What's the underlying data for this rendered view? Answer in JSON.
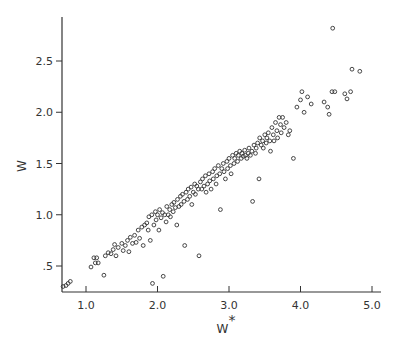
{
  "chart_data": {
    "type": "scatter",
    "title": "",
    "xlabel": "W*",
    "ylabel": "W",
    "xlim": [
      0.66,
      5.13
    ],
    "ylim": [
      0.26,
      2.93
    ],
    "grid": false,
    "legend": null,
    "x_ticks": [
      1.0,
      2.0,
      3.0,
      4.0,
      5.0
    ],
    "x_tick_labels": [
      "1.0",
      "2.0",
      "3.0",
      "4.0",
      "5.0"
    ],
    "y_ticks": [
      0.5,
      1.0,
      1.5,
      2.0,
      2.5
    ],
    "y_tick_labels": [
      ".5",
      "1.0",
      "1.5",
      "2.0",
      "2.5"
    ],
    "marker": "open-circle",
    "series": [
      {
        "name": "observations",
        "points": [
          [
            0.68,
            0.3
          ],
          [
            0.72,
            0.31
          ],
          [
            0.75,
            0.33
          ],
          [
            0.78,
            0.35
          ],
          [
            1.07,
            0.49
          ],
          [
            1.13,
            0.53
          ],
          [
            1.17,
            0.53
          ],
          [
            1.11,
            0.58
          ],
          [
            1.15,
            0.58
          ],
          [
            1.25,
            0.41
          ],
          [
            1.27,
            0.6
          ],
          [
            1.31,
            0.63
          ],
          [
            1.35,
            0.62
          ],
          [
            1.38,
            0.66
          ],
          [
            1.42,
            0.6
          ],
          [
            1.4,
            0.71
          ],
          [
            1.45,
            0.68
          ],
          [
            1.5,
            0.72
          ],
          [
            1.52,
            0.65
          ],
          [
            1.55,
            0.7
          ],
          [
            1.58,
            0.75
          ],
          [
            1.6,
            0.64
          ],
          [
            1.62,
            0.78
          ],
          [
            1.65,
            0.72
          ],
          [
            1.68,
            0.8
          ],
          [
            1.7,
            0.73
          ],
          [
            1.73,
            0.85
          ],
          [
            1.75,
            0.77
          ],
          [
            1.78,
            0.88
          ],
          [
            1.8,
            0.7
          ],
          [
            1.82,
            0.9
          ],
          [
            1.85,
            0.92
          ],
          [
            1.87,
            0.85
          ],
          [
            1.88,
            0.98
          ],
          [
            1.9,
            0.75
          ],
          [
            1.92,
            1.0
          ],
          [
            1.93,
            0.33
          ],
          [
            1.95,
            0.9
          ],
          [
            1.97,
            1.03
          ],
          [
            1.98,
            0.95
          ],
          [
            2.0,
            1.0
          ],
          [
            2.02,
            0.85
          ],
          [
            2.03,
            1.05
          ],
          [
            2.05,
            0.97
          ],
          [
            2.07,
            1.02
          ],
          [
            2.08,
            0.4
          ],
          [
            2.1,
            1.0
          ],
          [
            2.12,
            0.93
          ],
          [
            2.13,
            1.08
          ],
          [
            2.15,
            1.0
          ],
          [
            2.17,
            1.05
          ],
          [
            2.18,
            0.98
          ],
          [
            2.2,
            1.1
          ],
          [
            2.22,
            1.03
          ],
          [
            2.23,
            1.12
          ],
          [
            2.25,
            1.07
          ],
          [
            2.27,
            0.9
          ],
          [
            2.28,
            1.15
          ],
          [
            2.3,
            1.08
          ],
          [
            2.32,
            1.18
          ],
          [
            2.33,
            1.1
          ],
          [
            2.35,
            1.2
          ],
          [
            2.37,
            1.13
          ],
          [
            2.38,
            0.7
          ],
          [
            2.4,
            1.22
          ],
          [
            2.42,
            1.15
          ],
          [
            2.43,
            1.25
          ],
          [
            2.45,
            1.18
          ],
          [
            2.47,
            1.27
          ],
          [
            2.48,
            1.1
          ],
          [
            2.5,
            1.22
          ],
          [
            2.52,
            1.3
          ],
          [
            2.53,
            1.2
          ],
          [
            2.55,
            1.28
          ],
          [
            2.57,
            1.25
          ],
          [
            2.58,
            0.6
          ],
          [
            2.6,
            1.32
          ],
          [
            2.62,
            1.25
          ],
          [
            2.63,
            1.35
          ],
          [
            2.65,
            1.28
          ],
          [
            2.67,
            1.38
          ],
          [
            2.68,
            1.22
          ],
          [
            2.7,
            1.3
          ],
          [
            2.72,
            1.4
          ],
          [
            2.73,
            1.33
          ],
          [
            2.75,
            1.25
          ],
          [
            2.77,
            1.42
          ],
          [
            2.78,
            1.35
          ],
          [
            2.8,
            1.45
          ],
          [
            2.82,
            1.3
          ],
          [
            2.83,
            1.38
          ],
          [
            2.85,
            1.48
          ],
          [
            2.87,
            1.4
          ],
          [
            2.88,
            1.05
          ],
          [
            2.9,
            1.45
          ],
          [
            2.92,
            1.5
          ],
          [
            2.93,
            1.42
          ],
          [
            2.95,
            1.35
          ],
          [
            2.97,
            1.52
          ],
          [
            2.98,
            1.45
          ],
          [
            3.0,
            1.55
          ],
          [
            3.02,
            1.48
          ],
          [
            3.03,
            1.4
          ],
          [
            3.05,
            1.58
          ],
          [
            3.07,
            1.5
          ],
          [
            3.08,
            1.55
          ],
          [
            3.1,
            1.6
          ],
          [
            3.12,
            1.52
          ],
          [
            3.13,
            1.58
          ],
          [
            3.15,
            1.62
          ],
          [
            3.17,
            1.55
          ],
          [
            3.18,
            1.6
          ],
          [
            3.2,
            1.57
          ],
          [
            3.22,
            1.63
          ],
          [
            3.23,
            1.58
          ],
          [
            3.25,
            1.55
          ],
          [
            3.27,
            1.6
          ],
          [
            3.28,
            1.65
          ],
          [
            3.3,
            1.58
          ],
          [
            3.32,
            1.62
          ],
          [
            3.33,
            1.13
          ],
          [
            3.35,
            1.68
          ],
          [
            3.37,
            1.6
          ],
          [
            3.38,
            1.65
          ],
          [
            3.4,
            1.7
          ],
          [
            3.42,
            1.35
          ],
          [
            3.43,
            1.75
          ],
          [
            3.45,
            1.68
          ],
          [
            3.47,
            1.72
          ],
          [
            3.48,
            1.65
          ],
          [
            3.5,
            1.78
          ],
          [
            3.52,
            1.7
          ],
          [
            3.53,
            1.75
          ],
          [
            3.55,
            1.8
          ],
          [
            3.57,
            1.72
          ],
          [
            3.58,
            1.62
          ],
          [
            3.6,
            1.85
          ],
          [
            3.62,
            1.78
          ],
          [
            3.63,
            1.72
          ],
          [
            3.65,
            1.9
          ],
          [
            3.67,
            1.82
          ],
          [
            3.68,
            1.75
          ],
          [
            3.7,
            1.95
          ],
          [
            3.72,
            1.88
          ],
          [
            3.73,
            1.8
          ],
          [
            3.75,
            1.95
          ],
          [
            3.77,
            1.85
          ],
          [
            3.8,
            1.9
          ],
          [
            3.83,
            1.78
          ],
          [
            3.85,
            1.82
          ],
          [
            3.9,
            1.55
          ],
          [
            3.95,
            2.05
          ],
          [
            4.0,
            2.12
          ],
          [
            4.02,
            2.2
          ],
          [
            4.05,
            2.0
          ],
          [
            4.1,
            2.15
          ],
          [
            4.15,
            2.08
          ],
          [
            4.33,
            2.1
          ],
          [
            4.38,
            2.05
          ],
          [
            4.4,
            1.98
          ],
          [
            4.44,
            2.2
          ],
          [
            4.48,
            2.2
          ],
          [
            4.45,
            2.82
          ],
          [
            4.62,
            2.18
          ],
          [
            4.65,
            2.13
          ],
          [
            4.7,
            2.2
          ],
          [
            4.72,
            2.42
          ],
          [
            4.83,
            2.4
          ]
        ]
      }
    ]
  }
}
